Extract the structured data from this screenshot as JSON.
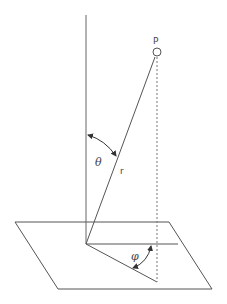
{
  "diagram": {
    "labels": {
      "point": "P",
      "radius": "r",
      "polar_angle": "θ",
      "azimuth_angle": "φ"
    },
    "colors": {
      "stroke": "#555555",
      "text": "#444444",
      "background": "#ffffff"
    }
  }
}
